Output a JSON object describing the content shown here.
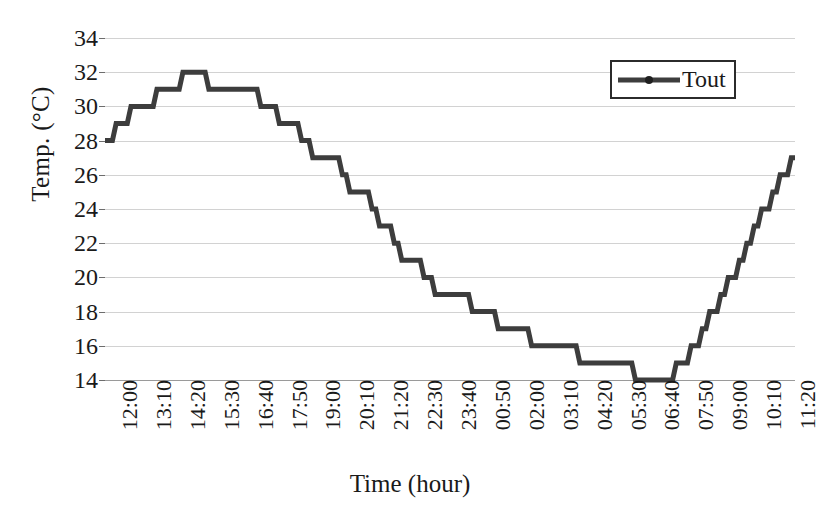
{
  "chart_data": {
    "type": "line",
    "title": "",
    "xlabel": "Time (hour)",
    "ylabel": "Temp. (°C)",
    "ylim": [
      14,
      34
    ],
    "ytick_step": 2,
    "yticks": [
      34,
      32,
      30,
      28,
      26,
      24,
      22,
      20,
      18,
      16,
      14
    ],
    "grid": true,
    "legend_position": "top-right",
    "legend_entries": [
      "Tout"
    ],
    "x_tick_labels": [
      "12:00",
      "13:10",
      "14:20",
      "15:30",
      "16:40",
      "17:50",
      "19:00",
      "20:10",
      "21:20",
      "22:30",
      "23:40",
      "00:50",
      "02:00",
      "03:10",
      "04:20",
      "05:30",
      "06:40",
      "07:50",
      "09:00",
      "10:10",
      "11:20"
    ],
    "x_tick_interval_minutes": 70,
    "sample_interval_minutes": 10,
    "series": [
      {
        "name": "Tout",
        "color": "#3d3d3d",
        "values": [
          28,
          28,
          28,
          29,
          29,
          29,
          29,
          30,
          30,
          30,
          30,
          30,
          30,
          30,
          31,
          31,
          31,
          31,
          31,
          31,
          31,
          32,
          32,
          32,
          32,
          32,
          32,
          32,
          31,
          31,
          31,
          31,
          31,
          31,
          31,
          31,
          31,
          31,
          31,
          31,
          31,
          31,
          30,
          30,
          30,
          30,
          30,
          29,
          29,
          29,
          29,
          29,
          29,
          28,
          28,
          28,
          27,
          27,
          27,
          27,
          27,
          27,
          27,
          27,
          26,
          26,
          25,
          25,
          25,
          25,
          25,
          25,
          24,
          24,
          23,
          23,
          23,
          23,
          22,
          22,
          21,
          21,
          21,
          21,
          21,
          21,
          20,
          20,
          20,
          19,
          19,
          19,
          19,
          19,
          19,
          19,
          19,
          19,
          19,
          18,
          18,
          18,
          18,
          18,
          18,
          18,
          17,
          17,
          17,
          17,
          17,
          17,
          17,
          17,
          17,
          16,
          16,
          16,
          16,
          16,
          16,
          16,
          16,
          16,
          16,
          16,
          16,
          16,
          15,
          15,
          15,
          15,
          15,
          15,
          15,
          15,
          15,
          15,
          15,
          15,
          15,
          15,
          15,
          14,
          14,
          14,
          14,
          14,
          14,
          14,
          14,
          14,
          14,
          14,
          15,
          15,
          15,
          15,
          16,
          16,
          16,
          17,
          17,
          18,
          18,
          18,
          19,
          19,
          20,
          20,
          20,
          21,
          21,
          22,
          22,
          23,
          23,
          24,
          24,
          24,
          25,
          25,
          26,
          26,
          26,
          27,
          27
        ]
      }
    ]
  },
  "axes": {
    "y_title": "Temp. (°C)",
    "x_title": "Time (hour)"
  },
  "legend": {
    "label": "Tout"
  }
}
